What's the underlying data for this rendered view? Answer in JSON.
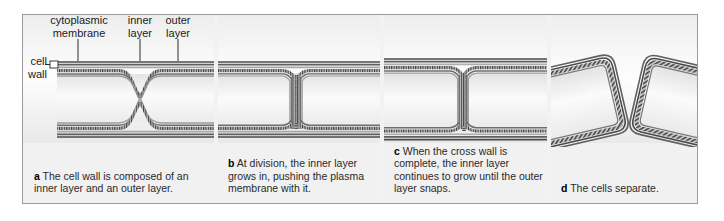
{
  "figure": {
    "labels": [
      {
        "id": "cell-wall",
        "text": "cell\nwall"
      },
      {
        "id": "cytoplasmic-membrane",
        "text": "cytoplasmic\nmembrane"
      },
      {
        "id": "inner-layer",
        "text": "inner\nlayer"
      },
      {
        "id": "outer-layer",
        "text": "outer\nlayer"
      }
    ],
    "panels": [
      {
        "id": "a",
        "letter": "a",
        "caption": "The cell wall is composed of an inner layer and an outer layer."
      },
      {
        "id": "b",
        "letter": "b",
        "caption": "At division, the inner layer grows in, pushing the plasma membrane with it."
      },
      {
        "id": "c",
        "letter": "c",
        "caption": "When the cross wall is complete, the inner layer continues to grow until the outer layer snaps."
      },
      {
        "id": "d",
        "letter": "d",
        "caption": "The cells separate."
      }
    ],
    "colors": {
      "outer_layer_line": "#4a4a4a",
      "inner_layer_hatch": "#3d3d3d",
      "cytoplasm": "#f7f7f7",
      "frame_border": "#9a9a9a",
      "background": "#f1f1f1"
    }
  }
}
